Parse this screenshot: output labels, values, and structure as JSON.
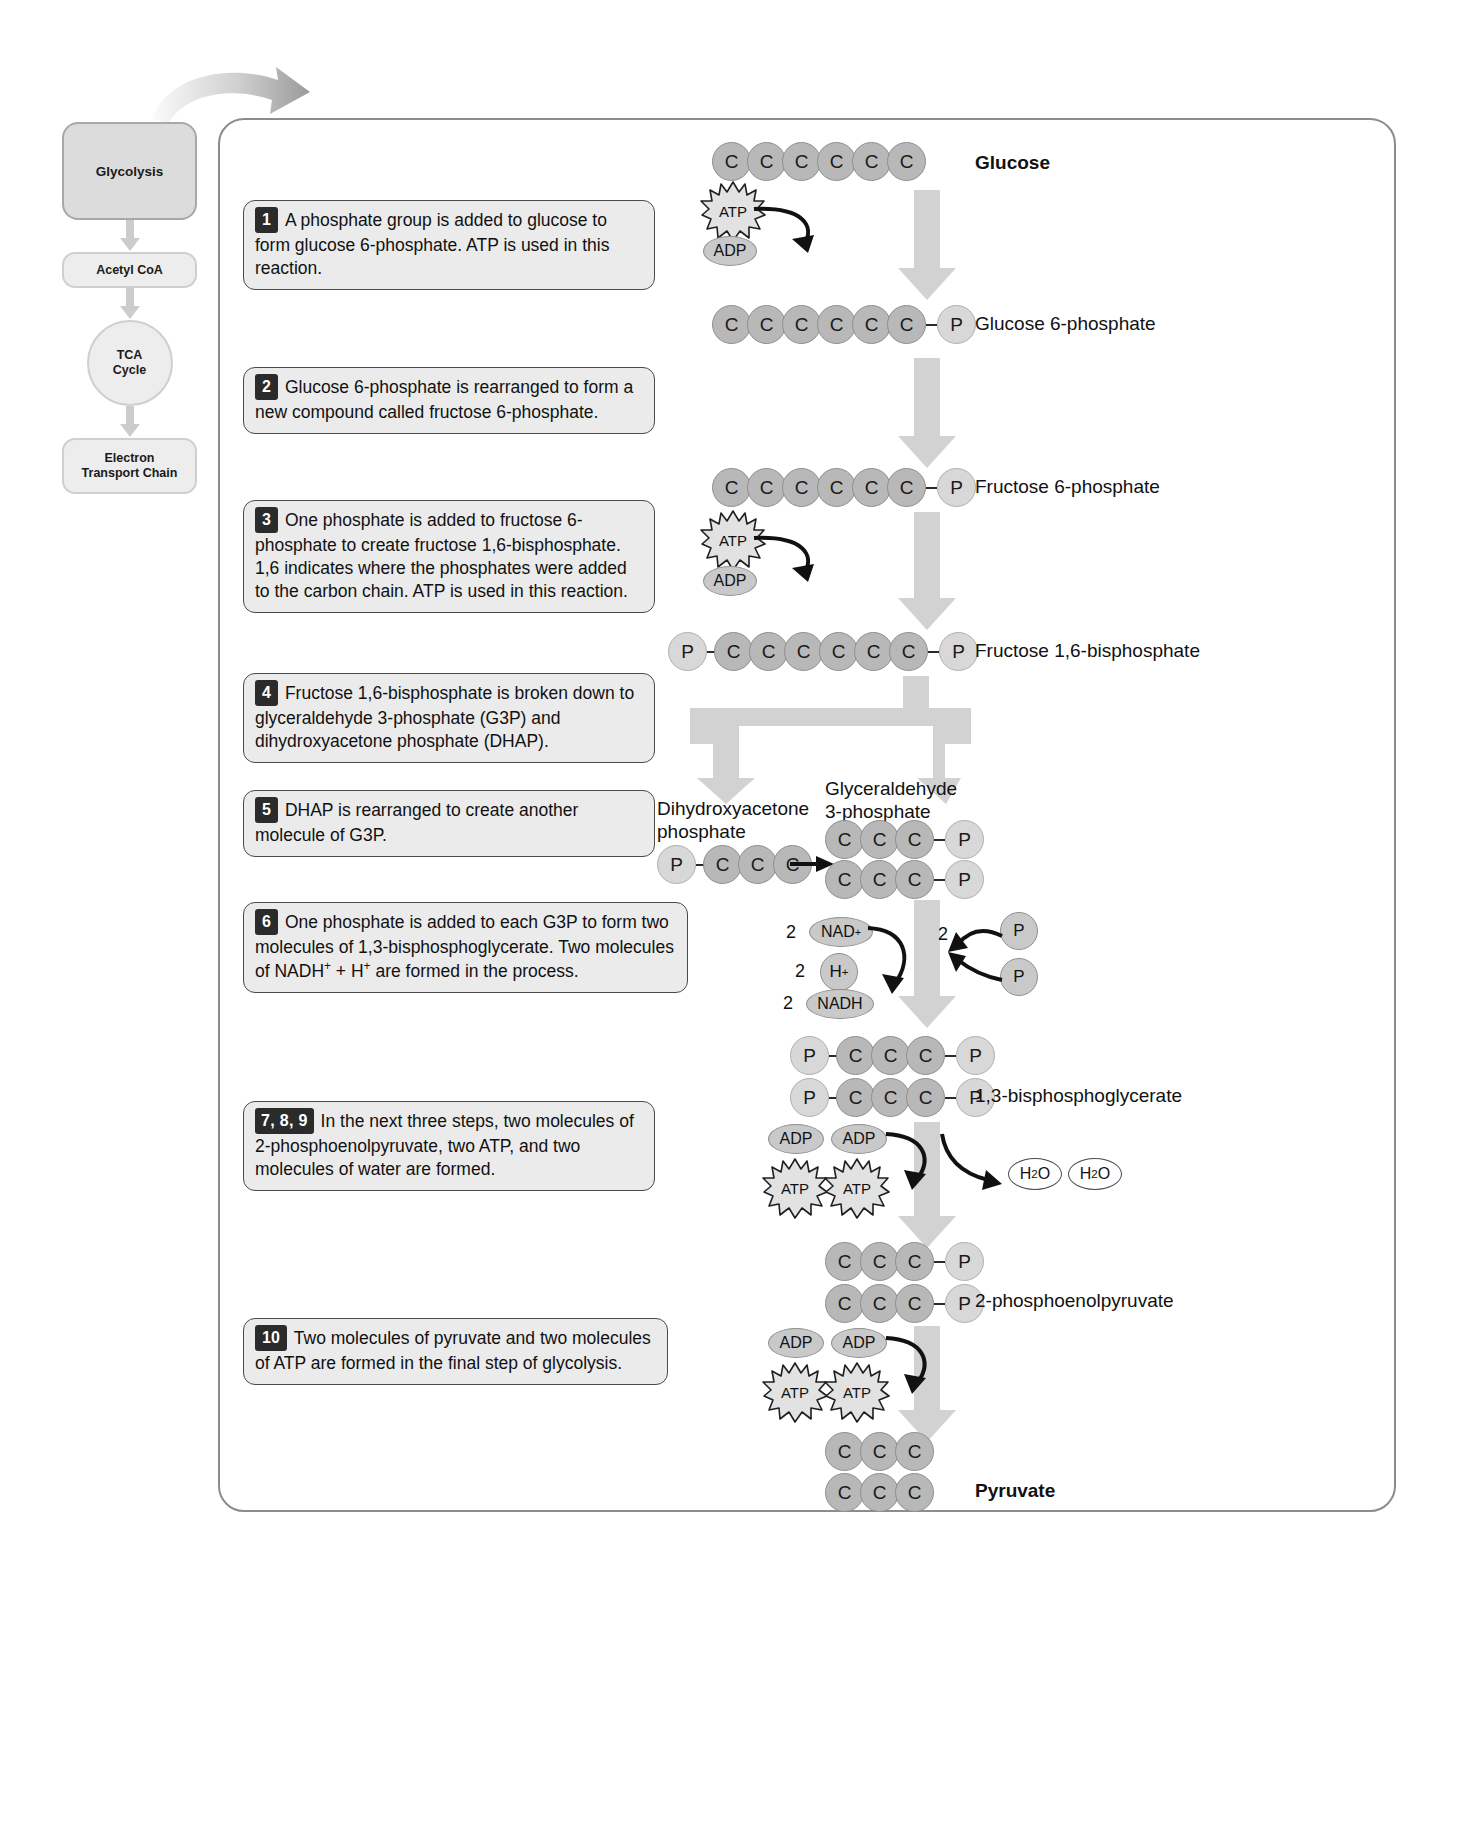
{
  "sidebar": {
    "items": [
      {
        "label": "Glycolysis",
        "shape": "box"
      },
      {
        "label": "Acetyl CoA",
        "shape": "pill"
      },
      {
        "label": "TCA\nCycle",
        "shape": "circle",
        "line1": "TCA",
        "line2": "Cycle"
      },
      {
        "label": "Electron\nTransport Chain",
        "shape": "pill",
        "line1": "Electron",
        "line2": "Transport Chain"
      }
    ]
  },
  "steps": [
    {
      "num": "1",
      "text": "A phosphate group is added to glucose to form glucose 6-phosphate. ATP is used in this reaction."
    },
    {
      "num": "2",
      "text": "Glucose 6-phosphate is rearranged to form a new compound called fructose 6-phosphate."
    },
    {
      "num": "3",
      "text": "One phosphate is added to fructose 6-phosphate to create fructose 1,6-bisphosphate. 1,6 indicates where the phosphates were added to the carbon chain. ATP is used in this reaction."
    },
    {
      "num": "4",
      "text": "Fructose 1,6-bisphosphate is broken down to glyceraldehyde 3-phosphate (G3P) and dihydroxyacetone phosphate (DHAP)."
    },
    {
      "num": "5",
      "text": "DHAP is rearranged to create another molecule of G3P."
    },
    {
      "num": "6",
      "text": "One phosphate is added to each G3P to form two molecules of 1,3-bisphosphoglycerate. Two molecules of NADH+ + H+ are formed in the process."
    },
    {
      "num": "7, 8, 9",
      "text": "In the next three steps, two molecules of 2-phosphoenolpyruvate, two ATP, and two molecules of water are formed."
    },
    {
      "num": "10",
      "text": "Two molecules of pyruvate and two molecules of ATP are formed in the final step of glycolysis."
    }
  ],
  "molecules": {
    "glucose": {
      "label": "Glucose",
      "carbons": 6,
      "phosphates": []
    },
    "glucose6p": {
      "label": "Glucose 6-phosphate",
      "carbons": 6,
      "tail_p": "P"
    },
    "fructose6p": {
      "label": "Fructose 6-phosphate",
      "carbons": 6,
      "tail_p": "P"
    },
    "fructose16bp": {
      "label": "Fructose 1,6-bisphosphate",
      "carbons": 6,
      "head_p": "P",
      "tail_p": "P"
    },
    "dhap": {
      "label_line1": "Dihydroxyacetone",
      "label_line2": "phosphate",
      "carbons": 3,
      "head_p": "P"
    },
    "g3p": {
      "label_line1": "Glyceraldehyde",
      "label_line2": "3-phosphate",
      "carbons": 3,
      "tail_p": "P",
      "count": 2
    },
    "bpg": {
      "label": "1,3-bisphosphoglycerate",
      "carbons": 3,
      "head_p": "P",
      "tail_p": "P",
      "count": 2
    },
    "pep": {
      "label": "2-phosphoenolpyruvate",
      "carbons": 3,
      "tail_p": "P",
      "count": 2
    },
    "pyruvate": {
      "label": "Pyruvate",
      "carbons": 3,
      "count": 2
    }
  },
  "cofactors": {
    "atp": "ATP",
    "adp": "ADP",
    "p": "P",
    "nad_plus": "NAD+",
    "h_plus": "H+",
    "nadh": "NADH",
    "water": "H2O",
    "two": "2",
    "c": "C"
  },
  "colors": {
    "carbon_fill": "#b8b8b8",
    "phosphate_fill": "#d8d8d8",
    "arrow_gray": "#d2d2d2",
    "callout_fill": "#ebebeb",
    "nav_fill": "#dcdcdc",
    "badge": "#2b2b2b"
  }
}
